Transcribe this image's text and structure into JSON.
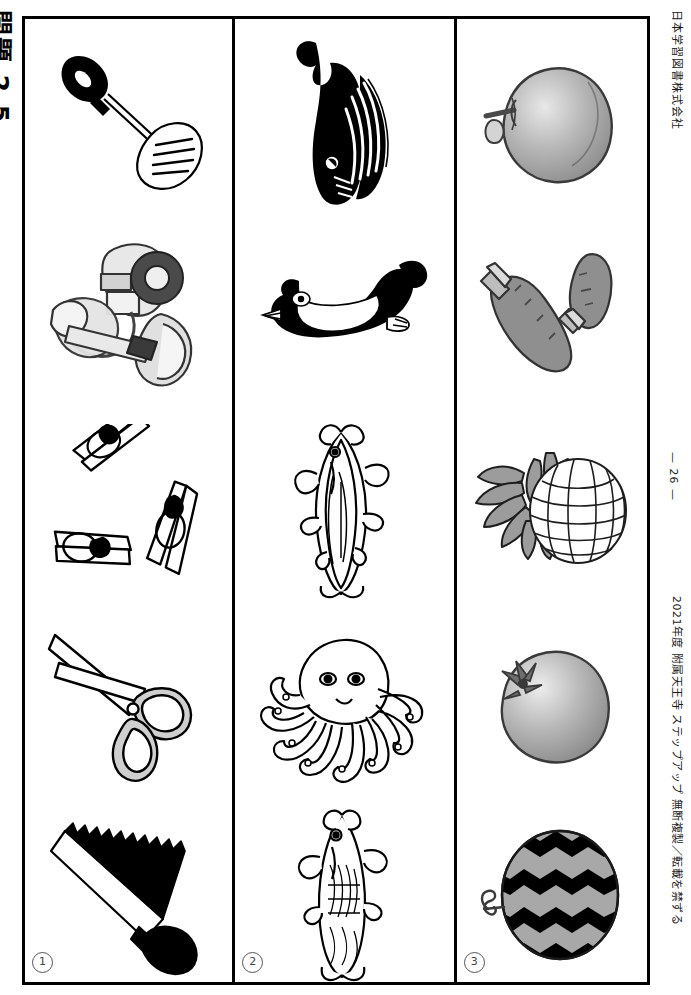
{
  "page": {
    "title_vertical": "問題 2 5",
    "publisher": "日本学習図書株式会社",
    "copyright": "2021年度 附属天王寺 ステップアップ 無断複製／転載を禁ずる",
    "page_number": "— 26 —"
  },
  "columns": [
    {
      "number": "1",
      "name": "column-tools",
      "items": [
        {
          "name": "spatula-illustration",
          "label": "spatula"
        },
        {
          "name": "can-opener-illustration",
          "label": "can opener"
        },
        {
          "name": "clothespins-illustration",
          "label": "clothespins"
        },
        {
          "name": "scissors-illustration",
          "label": "scissors"
        },
        {
          "name": "saw-illustration",
          "label": "saw"
        }
      ]
    },
    {
      "number": "2",
      "name": "column-sea-creatures",
      "items": [
        {
          "name": "whale-illustration",
          "label": "whale"
        },
        {
          "name": "penguin-illustration",
          "label": "penguin"
        },
        {
          "name": "tuna-illustration",
          "label": "tuna"
        },
        {
          "name": "octopus-illustration",
          "label": "octopus"
        },
        {
          "name": "fish-illustration",
          "label": "fish"
        }
      ]
    },
    {
      "number": "3",
      "name": "column-fruits-vegetables",
      "items": [
        {
          "name": "apple-illustration",
          "label": "apple"
        },
        {
          "name": "carrots-illustration",
          "label": "carrots"
        },
        {
          "name": "pineapple-illustration",
          "label": "pineapple"
        },
        {
          "name": "persimmon-illustration",
          "label": "persimmon"
        },
        {
          "name": "watermelon-illustration",
          "label": "watermelon"
        }
      ]
    }
  ],
  "colors": {
    "ink": "#000000",
    "paper": "#ffffff",
    "gray_fill": "#9a9a9a",
    "light_gray": "#d8d8d8",
    "mid_gray": "#6f6f6f"
  }
}
